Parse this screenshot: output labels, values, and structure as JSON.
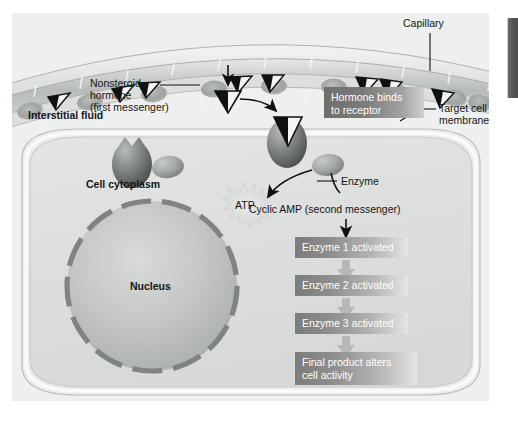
{
  "figure": {
    "background_color": "#eef0ef",
    "labels": {
      "capillary": "Capillary",
      "nonsteroid_hormone_line1": "Nonsteroid",
      "nonsteroid_hormone_line2": "hormone",
      "nonsteroid_hormone_line3": "(first messenger)",
      "interstitial_fluid": "Interstitial fluid",
      "target_cell_line1": "Target cell",
      "target_cell_line2": "membrane",
      "cell_cytoplasm": "Cell cytoplasm",
      "enzyme": "Enzyme",
      "atp": "ATP",
      "cyclic_amp": "Cyclic AMP (second messenger)",
      "nucleus": "Nucleus"
    },
    "callout_box": {
      "line1": "Hormone binds",
      "line2": "to receptor",
      "text_color": "#ffffff",
      "gradient_from": "#6f6f6f",
      "gradient_to": "#d0d0d0"
    },
    "cascade": [
      {
        "text": "Enzyme 1 activated"
      },
      {
        "text": "Enzyme 2 activated"
      },
      {
        "text": "Enzyme 3 activated"
      },
      {
        "text": "Final product alters\ncell activity",
        "line1": "Final product alters",
        "line2": "cell activity"
      }
    ],
    "colors": {
      "label_text": "#141414",
      "capillary_wall": "#b9bcbb",
      "blood_cell": "#a9adac",
      "receptor": "#6e7270",
      "nucleus_border": "#808483",
      "membrane": "#c9cbca",
      "cascade_arrow": "#b6b8b7",
      "right_bar": "#4a4a4a"
    }
  }
}
